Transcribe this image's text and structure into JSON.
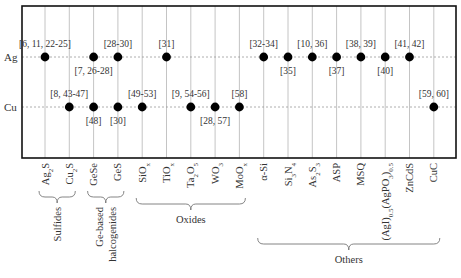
{
  "chart_data": {
    "type": "scatter",
    "title": "",
    "rows": [
      "Ag",
      "Cu"
    ],
    "columns": [
      {
        "key": "Ag2S",
        "base": "Ag",
        "sub": "2",
        "rest": "S"
      },
      {
        "key": "Cu2S",
        "base": "Cu",
        "sub": "2",
        "rest": "S"
      },
      {
        "key": "GeSe",
        "base": "GeSe",
        "sub": "",
        "rest": ""
      },
      {
        "key": "GeS",
        "base": "GeS",
        "sub": "",
        "rest": ""
      },
      {
        "key": "SiOx",
        "base": "SiO",
        "sub": "x",
        "rest": ""
      },
      {
        "key": "TiOx",
        "base": "TiO",
        "sub": "x",
        "rest": ""
      },
      {
        "key": "Ta2O5",
        "base": "Ta",
        "sub": "2",
        "rest": "O",
        "sub2": "5"
      },
      {
        "key": "WO3",
        "base": "WO",
        "sub": "3",
        "rest": ""
      },
      {
        "key": "MoOx",
        "base": "MoO",
        "sub": "x",
        "rest": ""
      },
      {
        "key": "a-Si",
        "base": "α-Si",
        "sub": "",
        "rest": ""
      },
      {
        "key": "Si3N4",
        "base": "Si",
        "sub": "3",
        "rest": "N",
        "sub2": "4"
      },
      {
        "key": "As2S3",
        "base": "As",
        "sub": "2",
        "rest": "S",
        "sub2": "3"
      },
      {
        "key": "ASP",
        "base": "ASP",
        "sub": "",
        "rest": ""
      },
      {
        "key": "MSQ",
        "base": "MSQ",
        "sub": "",
        "rest": ""
      },
      {
        "key": "AgIAgPO3",
        "base": "(AgI)",
        "sub": "0.5",
        "rest": "(AgPO",
        "sub2": "3",
        "rest2": ")",
        "sub3": "0.5"
      },
      {
        "key": "ZnCdS",
        "base": "ZnCdS",
        "sub": "",
        "rest": ""
      },
      {
        "key": "CuC",
        "base": "CuC",
        "sub": "",
        "rest": ""
      }
    ],
    "points": [
      {
        "row": "Ag",
        "col": 0,
        "label": "[6, 11, 22-25]",
        "label_pos": "above"
      },
      {
        "row": "Ag",
        "col": 2,
        "label": "[7, 26-28]",
        "label_pos": "below"
      },
      {
        "row": "Ag",
        "col": 3,
        "label": "[28-30]",
        "label_pos": "above"
      },
      {
        "row": "Ag",
        "col": 5,
        "label": "[31]",
        "label_pos": "above"
      },
      {
        "row": "Ag",
        "col": 9,
        "label": "[32-34]",
        "label_pos": "above"
      },
      {
        "row": "Ag",
        "col": 10,
        "label": "[35]",
        "label_pos": "below"
      },
      {
        "row": "Ag",
        "col": 11,
        "label": "[10, 36]",
        "label_pos": "above"
      },
      {
        "row": "Ag",
        "col": 12,
        "label": "[37]",
        "label_pos": "below"
      },
      {
        "row": "Ag",
        "col": 13,
        "label": "[38, 39]",
        "label_pos": "above"
      },
      {
        "row": "Ag",
        "col": 14,
        "label": "[40]",
        "label_pos": "below"
      },
      {
        "row": "Ag",
        "col": 15,
        "label": "[41, 42]",
        "label_pos": "above"
      },
      {
        "row": "Cu",
        "col": 1,
        "label": "[8, 43-47]",
        "label_pos": "above"
      },
      {
        "row": "Cu",
        "col": 2,
        "label": "[48]",
        "label_pos": "below"
      },
      {
        "row": "Cu",
        "col": 3,
        "label": "[30]",
        "label_pos": "below"
      },
      {
        "row": "Cu",
        "col": 4,
        "label": "[49-53]",
        "label_pos": "above"
      },
      {
        "row": "Cu",
        "col": 6,
        "label": "[9, 54-56]",
        "label_pos": "above"
      },
      {
        "row": "Cu",
        "col": 7,
        "label": "[28, 57]",
        "label_pos": "below"
      },
      {
        "row": "Cu",
        "col": 8,
        "label": "[58]",
        "label_pos": "above"
      },
      {
        "row": "Cu",
        "col": 16,
        "label": "[59, 60]",
        "label_pos": "above"
      }
    ],
    "groups": [
      {
        "label": "Sulfides",
        "from": 0,
        "to": 1,
        "lines": [
          "Sulfides"
        ]
      },
      {
        "label": "Ge-based halcogenides",
        "from": 2,
        "to": 3,
        "lines": [
          "Ge-based",
          "halcogenides"
        ]
      },
      {
        "label": "Oxides",
        "from": 4,
        "to": 8,
        "lines": [
          "Oxides"
        ]
      },
      {
        "label": "Others",
        "from": 9,
        "to": 16,
        "lines": [
          "Others"
        ]
      }
    ],
    "grid": true,
    "xlabel": "",
    "ylabel": ""
  },
  "colors": {
    "frame": "#111111",
    "grid": "#aaaaaa",
    "dot": "#000000",
    "text": "#333333"
  }
}
